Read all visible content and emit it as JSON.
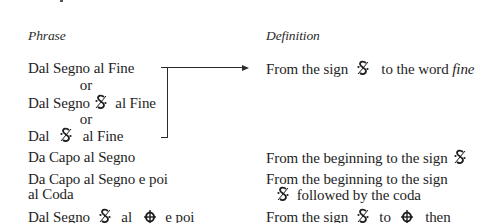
{
  "headers": {
    "phrase": "Phrase",
    "definition": "Definition"
  },
  "rows": [
    {
      "phrase_variants": [
        {
          "before": "Dal Segno al Fine",
          "symbol": null,
          "after": ""
        },
        {
          "connector": "or"
        },
        {
          "before": "Dal Segno",
          "symbol": "segno",
          "after": "al Fine"
        },
        {
          "connector": "or"
        },
        {
          "before": "Dal",
          "symbol": "segno",
          "after": "al Fine"
        }
      ],
      "definition": {
        "before": "From the sign",
        "symbol": "segno",
        "after": "to the word",
        "emphasis": "fine"
      }
    },
    {
      "phrase": "Da Capo al Segno",
      "definition": {
        "before": "From the beginning to the sign",
        "symbol": "segno"
      }
    },
    {
      "phrase_lines": [
        "Da Capo al Segno e poi",
        "al Coda"
      ],
      "definition_lines": [
        {
          "text": "From the beginning to the sign"
        },
        {
          "symbol": "segno",
          "text": "followed by the coda"
        }
      ]
    },
    {
      "phrase": {
        "p1": "Dal Segno",
        "sym1": "segno",
        "p2": "al",
        "sym2": "coda",
        "p3": "e poi"
      },
      "definition": {
        "p1": "From the sign",
        "sym1": "segno",
        "p2": "to",
        "sym2": "coda",
        "p3": "then"
      }
    }
  ],
  "symbols": {
    "segno": "segno-sign",
    "coda": "coda-sign"
  },
  "connector_or": "or",
  "colors": {
    "text": "#1e1e1e",
    "lines": "#2a2a2a",
    "background": "#ffffff"
  }
}
